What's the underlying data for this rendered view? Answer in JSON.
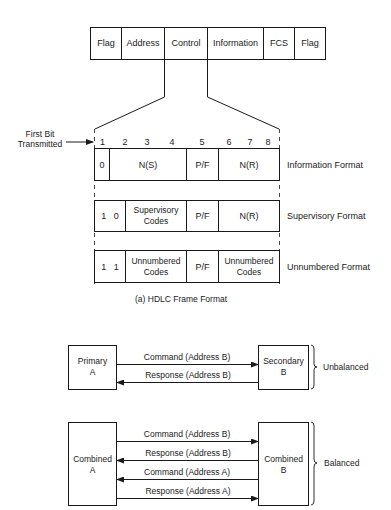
{
  "frame": {
    "fields": [
      "Flag",
      "Address",
      "Control",
      "Information",
      "FCS",
      "Flag"
    ]
  },
  "control": {
    "first_bit_label_line1": "First Bit",
    "first_bit_label_line2": "Transmitted",
    "bit_numbers": [
      "1",
      "2",
      "3",
      "4",
      "5",
      "6",
      "7",
      "8"
    ],
    "formats": [
      {
        "name": "Information Format",
        "cells": [
          {
            "line1": "0",
            "line2": ""
          },
          {
            "line1": "N(S)",
            "line2": ""
          },
          {
            "line1": "P/F",
            "line2": ""
          },
          {
            "line1": "N(R)",
            "line2": ""
          }
        ]
      },
      {
        "name": "Supervisory Format",
        "cells": [
          {
            "line1": "1   0",
            "line2": ""
          },
          {
            "line1": "Supervisory",
            "line2": "Codes"
          },
          {
            "line1": "P/F",
            "line2": ""
          },
          {
            "line1": "N(R)",
            "line2": ""
          }
        ]
      },
      {
        "name": "Unnumbered Format",
        "cells": [
          {
            "line1": "1   1",
            "line2": ""
          },
          {
            "line1": "Unnumbered",
            "line2": "Codes"
          },
          {
            "line1": "P/F",
            "line2": ""
          },
          {
            "line1": "Unnumbered",
            "line2": "Codes"
          }
        ]
      }
    ]
  },
  "caption": "(a)  HDLC Frame Format",
  "unbalanced": {
    "left_line1": "Primary",
    "left_line2": "A",
    "right_line1": "Secondary",
    "right_line2": "B",
    "label": "Unbalanced",
    "arrows": [
      {
        "label": "Command (Address B)",
        "direction": "right"
      },
      {
        "label": "Response (Address B)",
        "direction": "left"
      }
    ]
  },
  "balanced": {
    "left_line1": "Combined",
    "left_line2": "A",
    "right_line1": "Combined",
    "right_line2": "B",
    "label": "Balanced",
    "arrows": [
      {
        "label": "Command (Address B)",
        "direction": "right"
      },
      {
        "label": "Response (Address B)",
        "direction": "left"
      },
      {
        "label": "Command (Address A)",
        "direction": "left"
      },
      {
        "label": "Response (Address A)",
        "direction": "right"
      }
    ]
  },
  "colors": {
    "line": "#1a1a1a",
    "background": "#ffffff"
  }
}
